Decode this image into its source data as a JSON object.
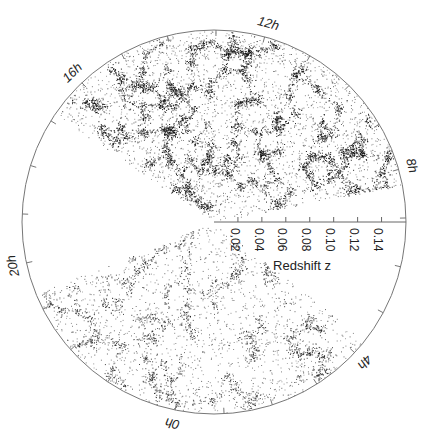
{
  "chart_data": {
    "type": "scatter",
    "subtype": "polar-wedge redshift survey cone diagram",
    "title": "",
    "radial_axis": {
      "label": "Redshift z",
      "range": [
        0,
        0.15
      ],
      "ticks": [
        0.02,
        0.04,
        0.06,
        0.08,
        0.1,
        0.12,
        0.14
      ],
      "tick_labels": [
        "0.02",
        "0.04",
        "0.06",
        "0.08",
        "0.10",
        "0.12",
        "0.14"
      ]
    },
    "angular_axis": {
      "unit": "hours of right ascension",
      "labeled_hours": [
        12,
        16,
        20,
        0,
        4,
        8
      ],
      "labels": [
        "12h",
        "16h",
        "20h",
        "0h",
        "4h",
        "8h"
      ],
      "tick_every_hours": 1
    },
    "wedges": [
      {
        "name": "northern slice",
        "ra_range_hours": [
          8.4,
          17.4
        ],
        "z_range": [
          0,
          0.15
        ],
        "density": "high"
      },
      {
        "name": "southern slice",
        "ra_range_hours": [
          20.9,
          4.7
        ],
        "z_range": [
          0,
          0.15
        ],
        "density": "medium"
      }
    ]
  }
}
